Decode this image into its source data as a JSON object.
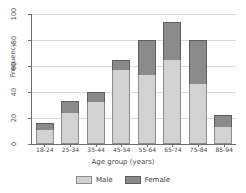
{
  "chart_data": {
    "type": "bar",
    "subtype": "stacked-vertical",
    "title": "",
    "xlabel": "Age group (years)",
    "ylabel": "Frequency",
    "categories": [
      "18-24",
      "25-34",
      "35-44",
      "45-54",
      "55-64",
      "65-74",
      "75-84",
      "85-94"
    ],
    "series": [
      {
        "name": "Male",
        "values": [
          11,
          24,
          32,
          57,
          53,
          65,
          46,
          13
        ]
      },
      {
        "name": "Female",
        "values": [
          5,
          9,
          8,
          8,
          27,
          29,
          34,
          9
        ]
      }
    ],
    "totals": [
      16,
      33,
      40,
      65,
      80,
      94,
      80,
      22
    ],
    "ylim": [
      0,
      100
    ],
    "yticks": [
      0,
      20,
      40,
      60,
      80,
      100
    ],
    "ytick_labels": [
      "0",
      "20",
      "40",
      "60",
      "80",
      "100"
    ],
    "grid": "horizontal",
    "legend_position": "bottom",
    "colors": {
      "male": "#d2d2d2",
      "male_border": "#8d8d8d",
      "female": "#8a8a8a",
      "female_border": "#5e5e5e",
      "grid": "#d9d9d9",
      "axis": "#6e6e6e",
      "text": "#4a4a4a",
      "background": "#ffffff"
    }
  },
  "legend": {
    "items": [
      {
        "label": "Male",
        "key": "male"
      },
      {
        "label": "Female",
        "key": "female"
      }
    ]
  }
}
